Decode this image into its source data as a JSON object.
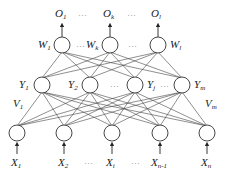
{
  "diagram": {
    "colors": {
      "background": "#ffffff",
      "line": "#444444",
      "text": "#222222"
    },
    "output_layer": {
      "labels": [
        {
          "base": "O",
          "sub": "1"
        },
        {
          "base": "O",
          "sub": "k"
        },
        {
          "base": "O",
          "sub": "l"
        }
      ],
      "weight_labels": [
        {
          "base": "W",
          "sub": "1"
        },
        {
          "base": "W",
          "sub": "k"
        },
        {
          "base": "W",
          "sub": "l"
        }
      ],
      "ellipsis": "…"
    },
    "hidden_layer": {
      "labels": [
        {
          "base": "Y",
          "sub": "1"
        },
        {
          "base": "Y",
          "sub": "2"
        },
        {
          "base": "Y",
          "sub": "j"
        },
        {
          "base": "Y",
          "sub": "m"
        }
      ],
      "weight_labels": [
        {
          "base": "V",
          "sub": "1"
        },
        {
          "base": "V",
          "sub": "m"
        }
      ],
      "ellipsis": "…"
    },
    "input_layer": {
      "labels": [
        {
          "base": "X",
          "sub": "1"
        },
        {
          "base": "X",
          "sub": "2"
        },
        {
          "base": "X",
          "sub": "i"
        },
        {
          "base": "X",
          "sub": "n-1"
        },
        {
          "base": "X",
          "sub": "n"
        }
      ],
      "ellipsis": "…"
    }
  }
}
